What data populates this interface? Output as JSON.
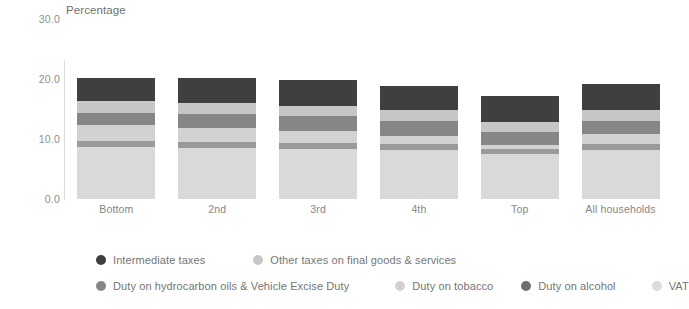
{
  "chart_data": {
    "type": "bar",
    "subtype": "stacked-bar",
    "title": "",
    "ylabel": "Percentage",
    "xlabel": "",
    "ylim": [
      0,
      30
    ],
    "yticks": [
      "0.0",
      "10.0",
      "20.0",
      "30.0"
    ],
    "ytick_values": [
      0,
      10,
      20,
      30
    ],
    "grid": false,
    "legend_position": "bottom",
    "categories": [
      "Bottom",
      "2nd",
      "3rd",
      "4th",
      "Top",
      "All households"
    ],
    "series": [
      {
        "name": "VAT",
        "color": "#d9d9d9",
        "values": [
          8.6,
          8.5,
          8.3,
          8.2,
          7.4,
          8.2
        ]
      },
      {
        "name": "Duty on alcohol",
        "color": "#9a9a9a",
        "values": [
          1.0,
          0.9,
          1.0,
          0.9,
          0.9,
          0.9
        ]
      },
      {
        "name": "Duty on tobacco",
        "color": "#d2d2d2",
        "values": [
          2.6,
          2.4,
          1.9,
          1.4,
          0.7,
          1.6
        ]
      },
      {
        "name": "Duty on hydrocarbon oils & Vehicle Excise Duty",
        "color": "#868686",
        "values": [
          2.1,
          2.3,
          2.5,
          2.4,
          2.1,
          2.3
        ]
      },
      {
        "name": "Other taxes on final goods & services",
        "color": "#c6c6c6",
        "values": [
          1.9,
          1.9,
          1.8,
          1.8,
          1.6,
          1.8
        ]
      },
      {
        "name": "Intermediate taxes",
        "color": "#3f3f3f",
        "values": [
          3.8,
          4.0,
          4.3,
          4.1,
          4.3,
          4.2
        ]
      }
    ],
    "totals": [
      20.0,
      20.0,
      19.8,
      18.8,
      17.0,
      19.0
    ]
  },
  "axis": {
    "y_title": "Percentage",
    "y_ticks": [
      {
        "label": "30.0",
        "value": 30
      },
      {
        "label": "20.0",
        "value": 20
      },
      {
        "label": "10.0",
        "value": 10
      },
      {
        "label": "0.0",
        "value": 0
      }
    ]
  },
  "legend": {
    "rows": [
      [
        {
          "label": "Intermediate taxes",
          "color": "#3f3f3f"
        },
        {
          "label": "Other taxes on final goods & services",
          "color": "#c6c6c6"
        }
      ],
      [
        {
          "label": "Duty on hydrocarbon oils & Vehicle Excise Duty",
          "color": "#868686"
        },
        {
          "label": "Duty on tobacco",
          "color": "#d2d2d2"
        },
        {
          "label": "Duty on alcohol",
          "color": "#6f6f6f"
        },
        {
          "label": "VAT",
          "color": "#dcdcdc"
        }
      ]
    ]
  },
  "colors": {
    "background": "#ffffff",
    "axis_line": "#dcdcdc",
    "tick_text": "#8e8e8e",
    "label_text": "#868686",
    "legend_text": "#757575"
  }
}
